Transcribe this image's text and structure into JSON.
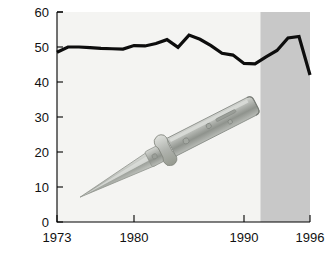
{
  "chart_data": {
    "type": "line",
    "title": "",
    "subtitle": "",
    "xlabel": "",
    "ylabel": "",
    "xlim": [
      1973,
      1996
    ],
    "ylim": [
      0,
      60
    ],
    "grid": false,
    "legend": "none",
    "x_ticks": [
      1973,
      1980,
      1990,
      1996
    ],
    "x_tick_labels": [
      "1973",
      "1980",
      "1990",
      "1996"
    ],
    "y_ticks": [
      0,
      10,
      20,
      30,
      40,
      50,
      60
    ],
    "y_tick_labels": [
      "0",
      "10",
      "20",
      "30",
      "40",
      "50",
      "60"
    ],
    "series": [
      {
        "name": "rate",
        "color": "#0d0d0d",
        "x": [
          1973,
          1974,
          1975,
          1976,
          1977,
          1978,
          1979,
          1980,
          1981,
          1982,
          1983,
          1984,
          1985,
          1986,
          1987,
          1988,
          1989,
          1990,
          1991,
          1992,
          1993,
          1994,
          1995,
          1996
        ],
        "values": [
          48.5,
          50.0,
          50.0,
          49.8,
          49.6,
          49.5,
          49.4,
          50.4,
          50.3,
          51.0,
          52.1,
          49.9,
          53.4,
          52.2,
          50.4,
          48.2,
          47.7,
          45.3,
          45.2,
          47.2,
          49.0,
          52.6,
          53.0,
          42.0
        ]
      }
    ],
    "annotations": [
      {
        "name": "shaded-band",
        "type": "vspan",
        "x_start": 1991.5,
        "x_end": 1996,
        "color": "#c8c8c8",
        "label": ""
      },
      {
        "name": "switchblade-knife-illustration",
        "type": "image-overlay",
        "description": "stiletto switchblade knife drawn diagonally across the plot area",
        "label": ""
      }
    ]
  },
  "axes": {
    "y": {
      "labels": [
        "60",
        "50",
        "40",
        "30",
        "20",
        "10",
        "0"
      ]
    },
    "x": {
      "labels": [
        "1973",
        "1980",
        "1990",
        "1996"
      ]
    }
  },
  "colors": {
    "line": "#0d0d0d",
    "plot_background": "#f4f4f2",
    "shade": "#c8c8c8",
    "axis": "#000000",
    "knife_steel": "#b9bcb8",
    "knife_handle": "#a9aca6"
  }
}
